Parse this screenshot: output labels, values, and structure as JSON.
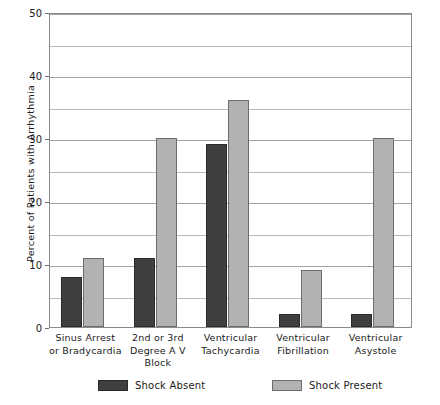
{
  "chart_data": {
    "type": "bar",
    "title": "",
    "xlabel": "",
    "ylabel": "Percent of Patients with Arrhythmia",
    "ylim": [
      0,
      50
    ],
    "yticks": [
      0,
      10,
      20,
      30,
      40,
      50
    ],
    "ytick_labels": [
      "0",
      "10",
      "20",
      "30",
      "40",
      "50"
    ],
    "gridlines": [
      0,
      5,
      10,
      15,
      20,
      25,
      30,
      35,
      40,
      45,
      50
    ],
    "grid": true,
    "legend_position": "bottom",
    "categories": [
      "Sinus Arrest\nor Bradycardia",
      "2nd or 3rd\nDegree A V\nBlock",
      "Ventricular\nTachycardia",
      "Ventricular\nFibrillation",
      "Ventricular\nAsystole"
    ],
    "category_lines": [
      [
        "Sinus Arrest",
        "or Bradycardia"
      ],
      [
        "2nd or 3rd",
        "Degree A V",
        "Block"
      ],
      [
        "Ventricular",
        "Tachycardia"
      ],
      [
        "Ventricular",
        "Fibrillation"
      ],
      [
        "Ventricular",
        "Asystole"
      ]
    ],
    "series": [
      {
        "name": "Shock Absent",
        "color": "#3f3f3f",
        "values": [
          8,
          11,
          29,
          2,
          2
        ]
      },
      {
        "name": "Shock Present",
        "color": "#b2b2b2",
        "values": [
          11,
          30,
          36,
          9,
          30
        ]
      }
    ]
  },
  "legend": {
    "entries": [
      {
        "label": "Shock Absent"
      },
      {
        "label": "Shock Present"
      }
    ]
  },
  "colors": {
    "shock_absent": "#3f3f3f",
    "shock_present": "#b2b2b2",
    "axis": "#8a8a8a",
    "grid": "#b9b9b9",
    "text": "#1a1a1a",
    "background": "#ffffff"
  }
}
